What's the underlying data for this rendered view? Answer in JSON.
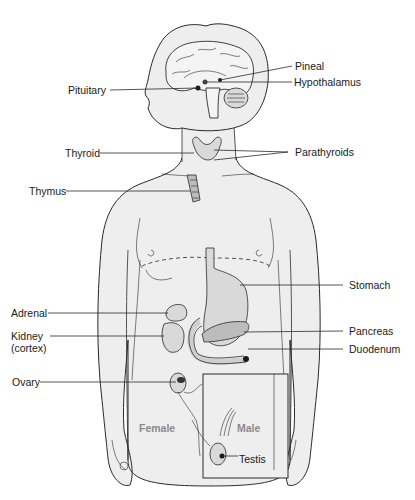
{
  "diagram": {
    "colors": {
      "background": "#ffffff",
      "body_fill": "#eeeeee",
      "outline": "#2a2a2a",
      "label_text": "#1a1a1a",
      "sex_label_text": "#8a8a8a"
    },
    "labels": {
      "pineal": "Pineal",
      "hypothalamus": "Hypothalamus",
      "pituitary": "Pituitary",
      "thyroid": "Thyroid",
      "parathyroids": "Parathyroids",
      "thymus": "Thymus",
      "stomach": "Stomach",
      "adrenal": "Adrenal",
      "kidney": "Kidney",
      "kidney_sub": "(cortex)",
      "pancreas": "Pancreas",
      "duodenum": "Duodenum",
      "ovary": "Ovary",
      "female": "Female",
      "male": "Male",
      "testis": "Testis"
    },
    "inset": {
      "label": "Male",
      "description": "Inset box showing male reproductive gland (testis)"
    }
  }
}
